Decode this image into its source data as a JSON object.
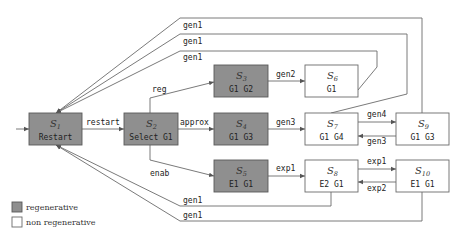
{
  "states": [
    {
      "id": "S1",
      "title": "S",
      "sub": "1",
      "label": "Restart",
      "type": "regenerative"
    },
    {
      "id": "S2",
      "title": "S",
      "sub": "2",
      "label": "Select G1",
      "type": "regenerative"
    },
    {
      "id": "S3",
      "title": "S",
      "sub": "3",
      "label": "G1 G2",
      "type": "regenerative"
    },
    {
      "id": "S4",
      "title": "S",
      "sub": "4",
      "label": "G1 G3",
      "type": "regenerative"
    },
    {
      "id": "S5",
      "title": "S",
      "sub": "5",
      "label": "E1 G1",
      "type": "regenerative"
    },
    {
      "id": "S6",
      "title": "S",
      "sub": "6",
      "label": "G1",
      "type": "non regenerative"
    },
    {
      "id": "S7",
      "title": "S",
      "sub": "7",
      "label": "G1 G4",
      "type": "non regenerative"
    },
    {
      "id": "S8",
      "title": "S",
      "sub": "8",
      "label": "E2 G1",
      "type": "non regenerative"
    },
    {
      "id": "S9",
      "title": "S",
      "sub": "9",
      "label": "G1 G3",
      "type": "non regenerative"
    },
    {
      "id": "S10",
      "title": "S",
      "sub": "10",
      "label": "E1 G1",
      "type": "non regenerative"
    }
  ],
  "transitions": [
    {
      "from": "S1",
      "to": "S2",
      "label": "restart"
    },
    {
      "from": "S2",
      "to": "S3",
      "label": "reg"
    },
    {
      "from": "S2",
      "to": "S4",
      "label": "approx"
    },
    {
      "from": "S2",
      "to": "S5",
      "label": "enab"
    },
    {
      "from": "S3",
      "to": "S6",
      "label": "gen2"
    },
    {
      "from": "S4",
      "to": "S7",
      "label": "gen3"
    },
    {
      "from": "S5",
      "to": "S8",
      "label": "exp1"
    },
    {
      "from": "S7",
      "to": "S9",
      "label": "gen4"
    },
    {
      "from": "S9",
      "to": "S7",
      "label": "gen3"
    },
    {
      "from": "S8",
      "to": "S10",
      "label": "exp1"
    },
    {
      "from": "S10",
      "to": "S8",
      "label": "exp2"
    },
    {
      "from": "S9",
      "to": "S1",
      "label": "gen1"
    },
    {
      "from": "S7",
      "to": "S1",
      "label": "gen1"
    },
    {
      "from": "S6",
      "to": "S1",
      "label": "gen1"
    },
    {
      "from": "S8",
      "to": "S1",
      "label": "gen1"
    },
    {
      "from": "S10",
      "to": "S1",
      "label": "gen1"
    }
  ],
  "legend": {
    "regenerative": "regenerative",
    "non_regenerative": "non regenerative"
  },
  "colors": {
    "regenerative": "#8f8f8f",
    "non_regenerative": "#ffffff"
  }
}
